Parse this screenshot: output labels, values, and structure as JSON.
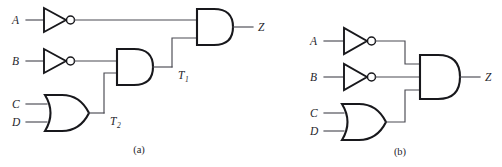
{
  "figure": {
    "width": 502,
    "height": 167,
    "background": "#ffffff",
    "line_color": "#4a4a52",
    "gate_color": "#18181c",
    "text_color": "#26262c"
  },
  "panels": [
    {
      "id": "a",
      "caption": "(a)",
      "description": "Cascaded two-input gate implementation with intermediate signals",
      "inputs": [
        {
          "label": "A"
        },
        {
          "label": "B"
        },
        {
          "label": "C"
        },
        {
          "label": "D"
        }
      ],
      "intermediate": [
        {
          "label": "T",
          "subscript": "1"
        },
        {
          "label": "T",
          "subscript": "2"
        }
      ],
      "output": {
        "label": "Z"
      },
      "gates": [
        {
          "type": "not",
          "name": "inverter-a"
        },
        {
          "type": "not",
          "name": "inverter-b"
        },
        {
          "type": "or",
          "name": "or-gate-cd",
          "inputs": 2
        },
        {
          "type": "and",
          "name": "and-gate-t1",
          "inputs": 2
        },
        {
          "type": "and",
          "name": "and-gate-output",
          "inputs": 2
        }
      ]
    },
    {
      "id": "b",
      "caption": "(b)",
      "description": "Three-input AND gate implementation",
      "inputs": [
        {
          "label": "A"
        },
        {
          "label": "B"
        },
        {
          "label": "C"
        },
        {
          "label": "D"
        }
      ],
      "intermediate": [],
      "output": {
        "label": "Z"
      },
      "gates": [
        {
          "type": "not",
          "name": "inverter-a"
        },
        {
          "type": "not",
          "name": "inverter-b"
        },
        {
          "type": "or",
          "name": "or-gate-cd",
          "inputs": 2
        },
        {
          "type": "and",
          "name": "and-gate-output",
          "inputs": 3
        }
      ]
    }
  ]
}
